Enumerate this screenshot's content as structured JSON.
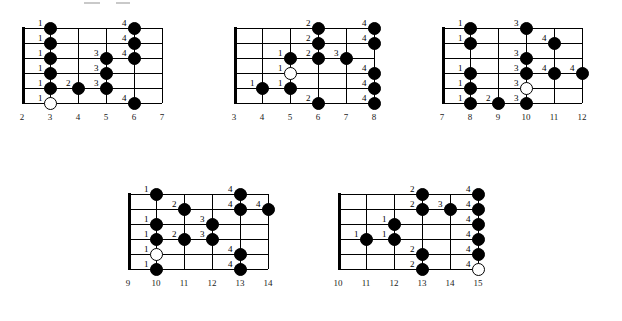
{
  "page": {
    "background_color": "#ffffff",
    "ink_color": "#000000"
  },
  "legend": {
    "filled_dot_meaning": "fretted note",
    "open_dot_meaning": "root note",
    "number_meaning": "fretting-hand finger number"
  },
  "diagrams": [
    {
      "id": "diagram-1",
      "position_label": "Position 1",
      "fret_numbers": [
        "2",
        "3",
        "4",
        "5",
        "6",
        "7"
      ],
      "string_count": 6,
      "has_nut": true,
      "notes": [
        {
          "string": 1,
          "fret": "3",
          "finger": "1",
          "open": false
        },
        {
          "string": 2,
          "fret": "3",
          "finger": "1",
          "open": false
        },
        {
          "string": 3,
          "fret": "3",
          "finger": "1",
          "open": false
        },
        {
          "string": 4,
          "fret": "3",
          "finger": "1",
          "open": false
        },
        {
          "string": 5,
          "fret": "3",
          "finger": "1",
          "open": false
        },
        {
          "string": 6,
          "fret": "3",
          "finger": "1",
          "open": true
        },
        {
          "string": 5,
          "fret": "4",
          "finger": "2",
          "open": false
        },
        {
          "string": 3,
          "fret": "5",
          "finger": "3",
          "open": false
        },
        {
          "string": 4,
          "fret": "5",
          "finger": "3",
          "open": false
        },
        {
          "string": 5,
          "fret": "5",
          "finger": "3",
          "open": false
        },
        {
          "string": 1,
          "fret": "6",
          "finger": "4",
          "open": false
        },
        {
          "string": 2,
          "fret": "6",
          "finger": "4",
          "open": false
        },
        {
          "string": 3,
          "fret": "6",
          "finger": "4",
          "open": false
        },
        {
          "string": 6,
          "fret": "6",
          "finger": "4",
          "open": false
        }
      ]
    },
    {
      "id": "diagram-2",
      "position_label": "Position 2",
      "fret_numbers": [
        "3",
        "4",
        "5",
        "6",
        "7",
        "8"
      ],
      "string_count": 6,
      "has_nut": true,
      "notes": [
        {
          "string": 5,
          "fret": "4",
          "finger": "1",
          "open": false
        },
        {
          "string": 3,
          "fret": "5",
          "finger": "1",
          "open": false
        },
        {
          "string": 4,
          "fret": "5",
          "finger": "1",
          "open": true
        },
        {
          "string": 5,
          "fret": "5",
          "finger": "1",
          "open": false
        },
        {
          "string": 1,
          "fret": "6",
          "finger": "2",
          "open": false
        },
        {
          "string": 2,
          "fret": "6",
          "finger": "2",
          "open": false
        },
        {
          "string": 3,
          "fret": "6",
          "finger": "2",
          "open": false
        },
        {
          "string": 6,
          "fret": "6",
          "finger": "2",
          "open": false
        },
        {
          "string": 3,
          "fret": "7",
          "finger": "3",
          "open": false
        },
        {
          "string": 1,
          "fret": "8",
          "finger": "4",
          "open": false
        },
        {
          "string": 2,
          "fret": "8",
          "finger": "4",
          "open": false
        },
        {
          "string": 4,
          "fret": "8",
          "finger": "4",
          "open": false
        },
        {
          "string": 5,
          "fret": "8",
          "finger": "4",
          "open": false
        },
        {
          "string": 6,
          "fret": "8",
          "finger": "4",
          "open": false
        }
      ]
    },
    {
      "id": "diagram-3",
      "position_label": "Position 3",
      "fret_numbers": [
        "7",
        "8",
        "9",
        "10",
        "11",
        "12"
      ],
      "string_count": 6,
      "has_nut": true,
      "notes": [
        {
          "string": 1,
          "fret": "8",
          "finger": "1",
          "open": false
        },
        {
          "string": 2,
          "fret": "8",
          "finger": "1",
          "open": false
        },
        {
          "string": 4,
          "fret": "8",
          "finger": "1",
          "open": false
        },
        {
          "string": 5,
          "fret": "8",
          "finger": "1",
          "open": false
        },
        {
          "string": 6,
          "fret": "8",
          "finger": "1",
          "open": false
        },
        {
          "string": 6,
          "fret": "9",
          "finger": "2",
          "open": false
        },
        {
          "string": 1,
          "fret": "10",
          "finger": "3",
          "open": false
        },
        {
          "string": 3,
          "fret": "10",
          "finger": "3",
          "open": false
        },
        {
          "string": 4,
          "fret": "10",
          "finger": "3",
          "open": false
        },
        {
          "string": 5,
          "fret": "10",
          "finger": "3",
          "open": true
        },
        {
          "string": 6,
          "fret": "10",
          "finger": "3",
          "open": false
        },
        {
          "string": 2,
          "fret": "11",
          "finger": "4",
          "open": false
        },
        {
          "string": 4,
          "fret": "11",
          "finger": "4",
          "open": false
        },
        {
          "string": 4,
          "fret": "12",
          "finger": "4",
          "open": false
        }
      ]
    },
    {
      "id": "diagram-4",
      "position_label": "Position 4",
      "fret_numbers": [
        "9",
        "10",
        "11",
        "12",
        "13",
        "14"
      ],
      "string_count": 6,
      "has_nut": true,
      "notes": [
        {
          "string": 1,
          "fret": "10",
          "finger": "1",
          "open": false
        },
        {
          "string": 3,
          "fret": "10",
          "finger": "1",
          "open": false
        },
        {
          "string": 4,
          "fret": "10",
          "finger": "1",
          "open": false
        },
        {
          "string": 5,
          "fret": "10",
          "finger": "1",
          "open": true
        },
        {
          "string": 6,
          "fret": "10",
          "finger": "1",
          "open": false
        },
        {
          "string": 2,
          "fret": "11",
          "finger": "2",
          "open": false
        },
        {
          "string": 4,
          "fret": "11",
          "finger": "2",
          "open": false
        },
        {
          "string": 3,
          "fret": "12",
          "finger": "3",
          "open": false
        },
        {
          "string": 4,
          "fret": "12",
          "finger": "3",
          "open": false
        },
        {
          "string": 1,
          "fret": "13",
          "finger": "4",
          "open": false
        },
        {
          "string": 2,
          "fret": "13",
          "finger": "4",
          "open": false
        },
        {
          "string": 5,
          "fret": "13",
          "finger": "4",
          "open": false
        },
        {
          "string": 6,
          "fret": "13",
          "finger": "4",
          "open": false
        },
        {
          "string": 2,
          "fret": "14",
          "finger": "4",
          "open": false
        }
      ]
    },
    {
      "id": "diagram-5",
      "position_label": "Position 5",
      "fret_numbers": [
        "10",
        "11",
        "12",
        "13",
        "14",
        "15"
      ],
      "string_count": 6,
      "has_nut": true,
      "notes": [
        {
          "string": 4,
          "fret": "11",
          "finger": "1",
          "open": false
        },
        {
          "string": 3,
          "fret": "12",
          "finger": "1",
          "open": false
        },
        {
          "string": 4,
          "fret": "12",
          "finger": "1",
          "open": false
        },
        {
          "string": 1,
          "fret": "13",
          "finger": "2",
          "open": false
        },
        {
          "string": 2,
          "fret": "13",
          "finger": "2",
          "open": false
        },
        {
          "string": 5,
          "fret": "13",
          "finger": "2",
          "open": false
        },
        {
          "string": 6,
          "fret": "13",
          "finger": "2",
          "open": false
        },
        {
          "string": 2,
          "fret": "14",
          "finger": "3",
          "open": false
        },
        {
          "string": 1,
          "fret": "15",
          "finger": "4",
          "open": false
        },
        {
          "string": 2,
          "fret": "15",
          "finger": "4",
          "open": false
        },
        {
          "string": 3,
          "fret": "15",
          "finger": "4",
          "open": false
        },
        {
          "string": 4,
          "fret": "15",
          "finger": "4",
          "open": false
        },
        {
          "string": 5,
          "fret": "15",
          "finger": "4",
          "open": false
        },
        {
          "string": 6,
          "fret": "15",
          "finger": "4",
          "open": true
        }
      ]
    }
  ],
  "layout": {
    "diagram_boxes": [
      {
        "id": "diagram-1",
        "left": 22,
        "top": 28,
        "width": 170,
        "height": 90,
        "label_top": 120
      },
      {
        "id": "diagram-2",
        "left": 234,
        "top": 28,
        "width": 170,
        "height": 90,
        "label_top": 120
      },
      {
        "id": "diagram-3",
        "left": 442,
        "top": 28,
        "width": 170,
        "height": 90,
        "label_top": 120
      },
      {
        "id": "diagram-4",
        "left": 128,
        "top": 194,
        "width": 170,
        "height": 90,
        "label_top": 286
      },
      {
        "id": "diagram-5",
        "left": 338,
        "top": 194,
        "width": 170,
        "height": 90,
        "label_top": 286
      }
    ]
  }
}
